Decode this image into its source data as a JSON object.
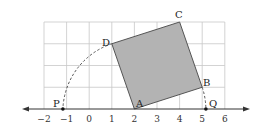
{
  "diagram": {
    "type": "number-line-square-construction",
    "axis": {
      "min": -2,
      "max": 6,
      "ticks": [
        "−2",
        "−1",
        "0",
        "1",
        "2",
        "3",
        "4",
        "5",
        "6"
      ]
    },
    "grid": {
      "x_range": [
        -2,
        6
      ],
      "y_range": [
        0,
        4
      ]
    },
    "square": {
      "fill": "#b3b3b3",
      "vertices": [
        {
          "name": "A",
          "x": 2,
          "y": 0
        },
        {
          "name": "B",
          "x": 5,
          "y": 1
        },
        {
          "name": "C",
          "x": 4,
          "y": 4
        },
        {
          "name": "D",
          "x": 1,
          "y": 3
        }
      ]
    },
    "points": [
      {
        "name": "P",
        "x": -1.16
      },
      {
        "name": "Q",
        "x": 5.16
      }
    ],
    "arcs": [
      {
        "center": "A",
        "from": "D",
        "to": "P",
        "style": "dashed"
      },
      {
        "center": "A",
        "from": "B",
        "to": "Q",
        "style": "dashed"
      }
    ]
  }
}
